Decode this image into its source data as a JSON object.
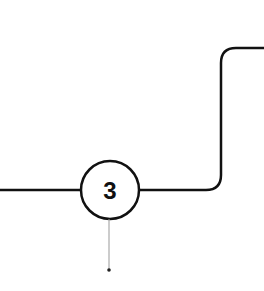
{
  "diagram": {
    "step": {
      "number": "3",
      "center": [
        110,
        190
      ],
      "radius": 29
    },
    "colors": {
      "stroke": "#111111",
      "connector": "#999999",
      "dot": "#222222",
      "background": "#ffffff"
    }
  }
}
